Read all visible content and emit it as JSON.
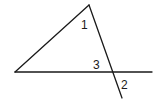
{
  "diagram": {
    "type": "geometry-angles",
    "labels": {
      "angle1": "1",
      "angle2": "2",
      "angle3": "3"
    },
    "points": {
      "apex": [
        89,
        5
      ],
      "left_vertex": [
        15,
        72
      ],
      "intersection": [
        113,
        72
      ],
      "horizontal_end": [
        152,
        72
      ],
      "transversal_end": [
        122,
        98
      ]
    },
    "stroke_color": "#1a1a1a",
    "background": "#ffffff"
  }
}
